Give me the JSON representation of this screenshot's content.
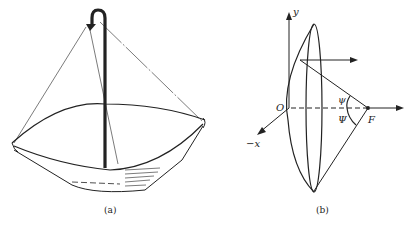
{
  "figure_a": {
    "caption": "(a)"
  },
  "figure_b": {
    "caption": "(b)",
    "labels": {
      "y_axis": "y",
      "x_axis": "−x",
      "origin": "O",
      "focus": "F",
      "psi_small": "ψ",
      "psi_large": "Ψ"
    }
  }
}
